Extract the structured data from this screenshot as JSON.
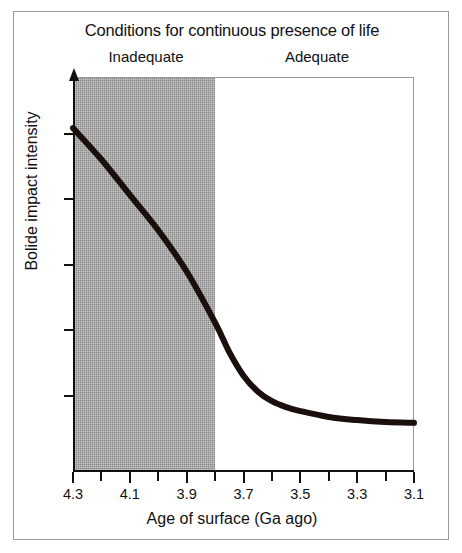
{
  "figure": {
    "title": "Conditions for continuous presence of life",
    "x_axis_title": "Age of surface (Ga ago)",
    "y_axis_title": "Bolide impact intensity",
    "band_inadequate_label": "Inadequate",
    "band_adequate_label": "Adequate",
    "frame_color": "#9a9a9a",
    "shading_color": "#878787",
    "curve_color": "#1a0f0c"
  },
  "chart_data": {
    "type": "line",
    "title": "Conditions for continuous presence of life",
    "xlabel": "Age of surface (Ga ago)",
    "ylabel": "Bolide impact intensity",
    "xlim": [
      4.3,
      3.1
    ],
    "ylim": [
      0,
      1
    ],
    "x_axis_reversed": true,
    "grid": false,
    "legend": null,
    "y_tick_labels": [],
    "y_ticks_count": 5,
    "x_ticks": [
      4.3,
      4.2,
      4.1,
      4.0,
      3.9,
      3.8,
      3.7,
      3.6,
      3.5,
      3.4,
      3.3,
      3.2,
      3.1
    ],
    "x_tick_labels": [
      "4.3",
      "4.1",
      "3.9",
      "3.7",
      "3.5",
      "3.3",
      "3.1"
    ],
    "x_labeled_values": [
      4.3,
      4.1,
      3.9,
      3.7,
      3.5,
      3.3,
      3.1
    ],
    "series": [
      {
        "name": "Bolide impact intensity",
        "x": [
          4.3,
          4.2,
          4.1,
          4.0,
          3.9,
          3.8,
          3.75,
          3.7,
          3.65,
          3.6,
          3.55,
          3.5,
          3.4,
          3.3,
          3.2,
          3.1
        ],
        "y": [
          0.87,
          0.79,
          0.7,
          0.61,
          0.505,
          0.375,
          0.3,
          0.24,
          0.2,
          0.175,
          0.16,
          0.15,
          0.135,
          0.127,
          0.122,
          0.12
        ]
      }
    ],
    "annotations": [
      {
        "label": "Inadequate",
        "x_range": [
          4.3,
          3.8
        ],
        "shaded": true,
        "note": "shaded region spanning 4.3 to 3.8 Ga"
      },
      {
        "label": "Adequate",
        "x_range": [
          3.8,
          3.1
        ],
        "shaded": false,
        "note": "unshaded region spanning 3.8 to 3.1 Ga"
      }
    ]
  }
}
